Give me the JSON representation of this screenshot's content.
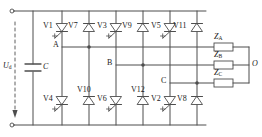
{
  "figure": {
    "kind": "circuit-schematic",
    "stroke_color": "#4d4d4d",
    "text_color": "#1a1a1a",
    "background": "#ffffff"
  },
  "source": {
    "voltage_label": "U",
    "voltage_sub": "d",
    "capacitor_label": "C",
    "arrow_name": "dc-voltage-arrow"
  },
  "upper_devices": [
    {
      "label": "V1",
      "type": "thyristor",
      "gate": true
    },
    {
      "label": "V7",
      "type": "diode",
      "gate": false
    },
    {
      "label": "V3",
      "type": "thyristor",
      "gate": true
    },
    {
      "label": "V9",
      "type": "diode",
      "gate": false
    },
    {
      "label": "V5",
      "type": "thyristor",
      "gate": true
    },
    {
      "label": "V11",
      "type": "diode",
      "gate": false
    }
  ],
  "lower_devices": [
    {
      "label": "V4",
      "type": "thyristor",
      "gate": true
    },
    {
      "label": "V10",
      "type": "diode",
      "gate": false
    },
    {
      "label": "V6",
      "type": "thyristor",
      "gate": true
    },
    {
      "label": "V12",
      "type": "diode",
      "gate": false
    },
    {
      "label": "V2",
      "type": "thyristor",
      "gate": true
    },
    {
      "label": "V8",
      "type": "diode",
      "gate": false
    }
  ],
  "phase_nodes": [
    {
      "label": "A"
    },
    {
      "label": "B"
    },
    {
      "label": "C"
    }
  ],
  "load": {
    "elements": [
      {
        "label": "Z",
        "sub": "A"
      },
      {
        "label": "Z",
        "sub": "B"
      },
      {
        "label": "Z",
        "sub": "C"
      }
    ],
    "neutral_label": "O"
  },
  "terminals": [
    {
      "name": "dc-positive-terminal"
    },
    {
      "name": "dc-negative-terminal"
    }
  ]
}
